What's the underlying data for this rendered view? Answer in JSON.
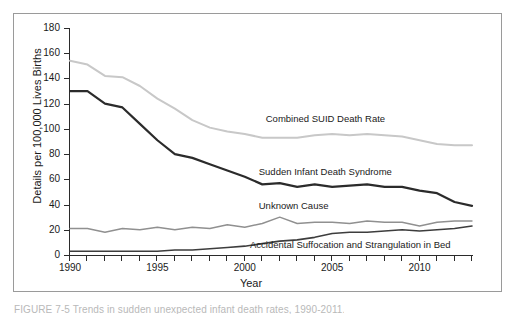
{
  "figure": {
    "caption": "FIGURE 7-5   Trends in sudden unexpected infant death rates, 1990-2011."
  },
  "chart_data": {
    "type": "line",
    "title": "",
    "xlabel": "Year",
    "ylabel": "Details per 100,000 Lives Births",
    "xlim": [
      1990,
      2013
    ],
    "ylim": [
      0,
      180
    ],
    "grid": false,
    "legend": "inline-annotations",
    "xticks": [
      1990,
      1995,
      2000,
      2005,
      2010
    ],
    "xtick_labels": [
      "1990",
      "1995",
      "2000",
      "2005",
      "2010"
    ],
    "yticks": [
      0,
      20,
      40,
      60,
      80,
      100,
      120,
      140,
      160,
      180
    ],
    "ytick_labels": [
      "0",
      "20",
      "40",
      "60",
      "80",
      "100",
      "120",
      "140",
      "160",
      "180"
    ],
    "x": [
      1990,
      1991,
      1992,
      1993,
      1994,
      1995,
      1996,
      1997,
      1998,
      1999,
      2000,
      2001,
      2002,
      2003,
      2004,
      2005,
      2006,
      2007,
      2008,
      2009,
      2010,
      2011,
      2012,
      2013
    ],
    "series": [
      {
        "name": "Combined SUID Death Rate",
        "color": "#c8c8c8",
        "width": 2.0,
        "label_x": 2001.2,
        "label_y": 108,
        "values": [
          154,
          151,
          142,
          141,
          134,
          124,
          116,
          107,
          101,
          98,
          96,
          93,
          93,
          93,
          95,
          96,
          95,
          96,
          95,
          94,
          91,
          88,
          87,
          87
        ]
      },
      {
        "name": "Sudden Infant Death Syndrome",
        "color": "#2b2b2b",
        "width": 2.2,
        "label_x": 2000.8,
        "label_y": 66,
        "values": [
          130,
          130,
          120,
          117,
          104,
          91,
          80,
          77,
          72,
          67,
          62,
          56,
          57,
          54,
          56,
          54,
          55,
          56,
          54,
          54,
          51,
          49,
          42,
          39
        ]
      },
      {
        "name": "Unknown Cause",
        "color": "#909090",
        "width": 1.4,
        "label_x": 2000.8,
        "label_y": 39,
        "values": [
          21,
          21,
          18,
          21,
          20,
          22,
          20,
          22,
          21,
          24,
          22,
          25,
          30,
          25,
          26,
          26,
          25,
          27,
          26,
          26,
          23,
          26,
          27,
          27
        ]
      },
      {
        "name": "Accidental Suffocation and Strangulation in Bed",
        "color": "#3d3d3d",
        "width": 1.6,
        "label_x": 2000.3,
        "label_y": 8,
        "values": [
          3,
          3,
          3,
          3,
          3,
          3,
          4,
          4,
          5,
          6,
          7,
          9,
          11,
          12,
          14,
          17,
          18,
          18,
          19,
          20,
          19,
          20,
          21,
          23
        ]
      }
    ]
  }
}
